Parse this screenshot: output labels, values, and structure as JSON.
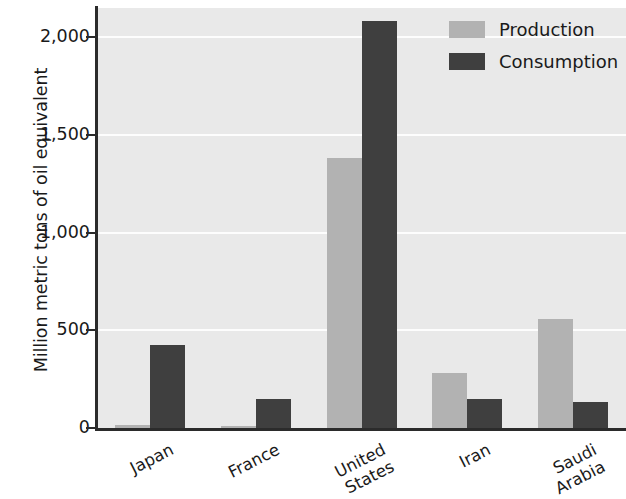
{
  "chart_data": {
    "type": "bar",
    "title": "",
    "xlabel": "",
    "ylabel": "Million metric tons of oil equivalent",
    "categories": [
      "Japan",
      "France",
      "United States",
      "Iran",
      "Saudi Arabia"
    ],
    "category_lines": [
      [
        "Japan"
      ],
      [
        "France"
      ],
      [
        "United",
        "States"
      ],
      [
        "Iran"
      ],
      [
        "Saudi",
        "Arabia"
      ]
    ],
    "series": [
      {
        "name": "Production",
        "values": [
          15,
          10,
          1382,
          283,
          560
        ],
        "color": "#b2b2b2"
      },
      {
        "name": "Consumption",
        "values": [
          427,
          148,
          2081,
          149,
          134
        ],
        "color": "#3f3f3f"
      }
    ],
    "ylim": [
      0,
      2150
    ],
    "yticks": [
      0,
      500,
      1000,
      1500,
      2000
    ],
    "ytick_labels": [
      "0",
      "500",
      "1,000",
      "1,500",
      "2,000"
    ],
    "grid": true,
    "grid_color": "#fdfdfd",
    "plot_background": "#e9e9e9",
    "legend_position": "top-right",
    "axis_color": "#2b2b2b"
  }
}
